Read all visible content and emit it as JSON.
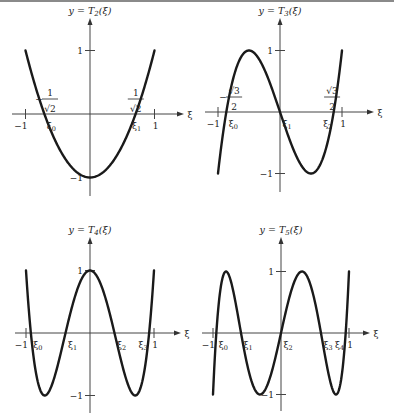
{
  "chart_data": [
    {
      "type": "line",
      "title": "y = T2(ξ)",
      "title_main": "y = T",
      "title_sub": "2",
      "title_tail": "(ξ)",
      "xlabel": "ξ",
      "xlim": [
        -1,
        1
      ],
      "ylim": [
        -1,
        1
      ],
      "x_ticks": [
        "-1",
        "1"
      ],
      "y_ticks": [
        "1",
        "-1"
      ],
      "roots": [
        "ξ0",
        "ξ1"
      ],
      "annotations": [
        "-1/√2",
        "1/√2"
      ],
      "formula": "2x^2 - 1"
    },
    {
      "type": "line",
      "title": "y = T3(ξ)",
      "title_main": "y = T",
      "title_sub": "3",
      "title_tail": "(ξ)",
      "xlabel": "ξ",
      "xlim": [
        -1,
        1
      ],
      "ylim": [
        -1,
        1
      ],
      "x_ticks": [
        "-1",
        "1"
      ],
      "y_ticks": [
        "1",
        "-1"
      ],
      "roots": [
        "ξ0",
        "ξ1",
        "ξ2"
      ],
      "annotations": [
        "-√3/2",
        "√3/2"
      ],
      "formula": "4x^3 - 3x"
    },
    {
      "type": "line",
      "title": "y = T4(ξ)",
      "title_main": "y = T",
      "title_sub": "4",
      "title_tail": "(ξ)",
      "xlabel": "ξ",
      "xlim": [
        -1,
        1
      ],
      "ylim": [
        -1,
        1
      ],
      "x_ticks": [
        "-1",
        "1"
      ],
      "y_ticks": [
        "1",
        "-1"
      ],
      "roots": [
        "ξ0",
        "ξ1",
        "ξ2",
        "ξ3"
      ],
      "formula": "8x^4 - 8x^2 + 1"
    },
    {
      "type": "line",
      "title": "y = T5(ξ)",
      "title_main": "y = T",
      "title_sub": "5",
      "title_tail": "(ξ)",
      "xlabel": "ξ",
      "xlim": [
        -1,
        1
      ],
      "ylim": [
        -1,
        1
      ],
      "x_ticks": [
        "-1",
        "1"
      ],
      "y_ticks": [
        "1",
        "-1"
      ],
      "roots": [
        "ξ0",
        "ξ1",
        "ξ2",
        "ξ3",
        "ξ4"
      ],
      "formula": "16x^5 - 20x^3 + 5x"
    }
  ],
  "labels": {
    "minus_one": "−1",
    "one": "1",
    "xi": "ξ",
    "y_eq": "y = ",
    "T": "T",
    "paren": "(ξ)",
    "one_num": "1",
    "sqrt2": "√2",
    "sqrt3": "√3",
    "two": "2",
    "minus": "−"
  }
}
